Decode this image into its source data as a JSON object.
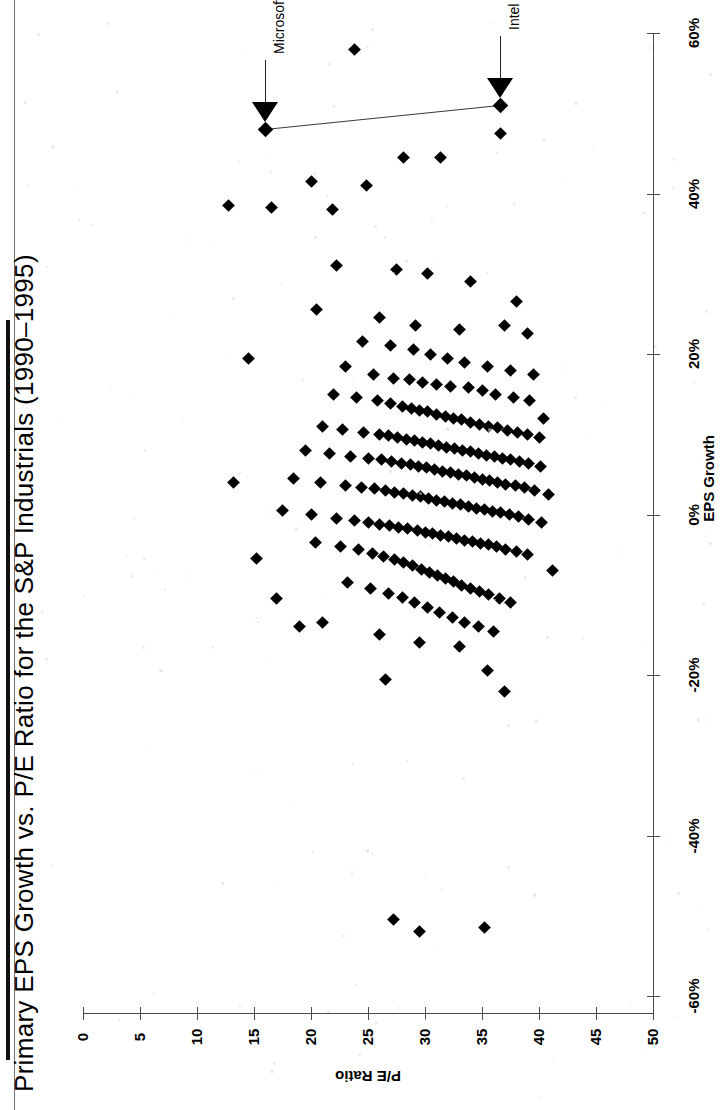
{
  "title": "Primary EPS Growth vs. P/E Ratio for the S&P Industrials (1990–1995)",
  "axes": {
    "pe": {
      "label": "P/E Ratio",
      "ticks": [
        "50",
        "45",
        "40",
        "35",
        "30",
        "25",
        "20",
        "15",
        "10",
        "5",
        "0"
      ]
    },
    "eps": {
      "label": "EPS Growth",
      "ticks": [
        "60%",
        "40%",
        "20%",
        "0%",
        "-20%",
        "-40%",
        "-60%"
      ]
    }
  },
  "annotations": [
    {
      "name": "microsoft",
      "label": "Microsoft"
    },
    {
      "name": "intel",
      "label": "Intel"
    }
  ],
  "chart_data": {
    "type": "scatter",
    "title": "Primary EPS Growth vs. P/E Ratio for the S&P Industrials (1990–1995)",
    "orientation": "rotated-90",
    "xlabel": "P/E Ratio",
    "ylabel": "EPS Growth",
    "xlim": [
      0,
      50
    ],
    "ylim": [
      -60,
      60
    ],
    "xticks": [
      0,
      5,
      10,
      15,
      20,
      25,
      30,
      35,
      40,
      45,
      50
    ],
    "yticks": [
      -60,
      -40,
      -20,
      0,
      20,
      40,
      60
    ],
    "ytick_format": "percent",
    "grid": false,
    "legend": null,
    "marker": "diamond",
    "marker_color": "#000000",
    "annotations": [
      {
        "label": "Microsoft",
        "pe": 34.0,
        "eps": 48.0
      },
      {
        "label": "Intel",
        "pe": 13.4,
        "eps": 51.0
      }
    ],
    "connector": {
      "from": "Microsoft",
      "to": "Intel"
    },
    "points": [
      [
        34.0,
        48.0
      ],
      [
        13.4,
        51.0
      ],
      [
        13.4,
        47.5
      ],
      [
        26.2,
        58.0
      ],
      [
        21.9,
        44.5
      ],
      [
        18.6,
        44.5
      ],
      [
        30.0,
        41.5
      ],
      [
        25.1,
        41.0
      ],
      [
        37.2,
        38.5
      ],
      [
        33.5,
        38.3
      ],
      [
        28.1,
        38.0
      ],
      [
        27.8,
        31.0
      ],
      [
        22.5,
        30.5
      ],
      [
        19.8,
        30.0
      ],
      [
        16.0,
        29.0
      ],
      [
        29.5,
        25.5
      ],
      [
        24.0,
        24.5
      ],
      [
        20.8,
        23.5
      ],
      [
        17.0,
        23.0
      ],
      [
        13.0,
        23.5
      ],
      [
        11.0,
        22.5
      ],
      [
        25.5,
        21.5
      ],
      [
        23.0,
        21.0
      ],
      [
        21.0,
        20.5
      ],
      [
        19.5,
        20.0
      ],
      [
        18.0,
        19.5
      ],
      [
        16.5,
        19.0
      ],
      [
        14.5,
        18.5
      ],
      [
        12.5,
        18.0
      ],
      [
        27.0,
        18.5
      ],
      [
        24.5,
        17.5
      ],
      [
        22.8,
        17.0
      ],
      [
        21.4,
        16.8
      ],
      [
        20.2,
        16.5
      ],
      [
        19.0,
        16.2
      ],
      [
        17.8,
        16.0
      ],
      [
        16.2,
        15.8
      ],
      [
        15.0,
        15.4
      ],
      [
        13.8,
        15.0
      ],
      [
        12.2,
        14.6
      ],
      [
        10.8,
        14.2
      ],
      [
        28.0,
        15.0
      ],
      [
        26.0,
        14.6
      ],
      [
        24.2,
        14.2
      ],
      [
        23.0,
        13.8
      ],
      [
        22.0,
        13.5
      ],
      [
        21.2,
        13.2
      ],
      [
        20.5,
        13.0
      ],
      [
        19.8,
        12.8
      ],
      [
        19.0,
        12.5
      ],
      [
        18.2,
        12.2
      ],
      [
        17.5,
        12.0
      ],
      [
        16.8,
        11.8
      ],
      [
        16.0,
        11.5
      ],
      [
        15.2,
        11.2
      ],
      [
        14.4,
        11.0
      ],
      [
        13.6,
        10.8
      ],
      [
        12.8,
        10.5
      ],
      [
        11.9,
        10.2
      ],
      [
        11.0,
        10.0
      ],
      [
        10.0,
        9.6
      ],
      [
        29.0,
        11.0
      ],
      [
        27.2,
        10.6
      ],
      [
        25.4,
        10.2
      ],
      [
        24.0,
        10.0
      ],
      [
        23.2,
        9.8
      ],
      [
        22.4,
        9.6
      ],
      [
        21.6,
        9.4
      ],
      [
        20.9,
        9.2
      ],
      [
        20.2,
        9.0
      ],
      [
        19.5,
        8.8
      ],
      [
        18.8,
        8.6
      ],
      [
        18.1,
        8.4
      ],
      [
        17.4,
        8.2
      ],
      [
        16.7,
        8.0
      ],
      [
        16.0,
        7.8
      ],
      [
        15.3,
        7.6
      ],
      [
        14.6,
        7.4
      ],
      [
        13.9,
        7.2
      ],
      [
        13.2,
        7.0
      ],
      [
        12.5,
        6.8
      ],
      [
        11.7,
        6.6
      ],
      [
        10.9,
        6.4
      ],
      [
        9.9,
        6.0
      ],
      [
        30.5,
        8.0
      ],
      [
        28.4,
        7.6
      ],
      [
        26.5,
        7.2
      ],
      [
        25.0,
        7.0
      ],
      [
        23.8,
        6.8
      ],
      [
        22.9,
        6.6
      ],
      [
        22.1,
        6.4
      ],
      [
        21.3,
        6.2
      ],
      [
        20.6,
        6.0
      ],
      [
        19.9,
        5.8
      ],
      [
        19.2,
        5.6
      ],
      [
        18.5,
        5.4
      ],
      [
        17.8,
        5.2
      ],
      [
        17.1,
        5.0
      ],
      [
        16.4,
        4.8
      ],
      [
        15.7,
        4.6
      ],
      [
        15.0,
        4.4
      ],
      [
        14.3,
        4.2
      ],
      [
        13.6,
        4.0
      ],
      [
        12.9,
        3.8
      ],
      [
        12.1,
        3.6
      ],
      [
        11.3,
        3.4
      ],
      [
        10.4,
        3.0
      ],
      [
        31.5,
        4.5
      ],
      [
        29.2,
        4.0
      ],
      [
        27.0,
        3.6
      ],
      [
        25.6,
        3.4
      ],
      [
        24.4,
        3.2
      ],
      [
        23.5,
        3.0
      ],
      [
        22.7,
        2.8
      ],
      [
        21.9,
        2.6
      ],
      [
        21.1,
        2.4
      ],
      [
        20.4,
        2.2
      ],
      [
        19.7,
        2.0
      ],
      [
        19.0,
        1.8
      ],
      [
        18.3,
        1.6
      ],
      [
        17.6,
        1.4
      ],
      [
        16.9,
        1.2
      ],
      [
        16.2,
        1.0
      ],
      [
        15.5,
        0.8
      ],
      [
        14.8,
        0.6
      ],
      [
        14.1,
        0.4
      ],
      [
        13.4,
        0.2
      ],
      [
        12.6,
        0.0
      ],
      [
        11.8,
        -0.3
      ],
      [
        10.9,
        -0.6
      ],
      [
        9.8,
        -1.0
      ],
      [
        32.5,
        0.5
      ],
      [
        30.0,
        0.0
      ],
      [
        27.8,
        -0.5
      ],
      [
        26.2,
        -0.8
      ],
      [
        25.0,
        -1.0
      ],
      [
        24.0,
        -1.2
      ],
      [
        23.1,
        -1.4
      ],
      [
        22.3,
        -1.6
      ],
      [
        21.5,
        -1.8
      ],
      [
        20.7,
        -2.0
      ],
      [
        20.0,
        -2.2
      ],
      [
        19.3,
        -2.4
      ],
      [
        18.6,
        -2.6
      ],
      [
        17.9,
        -2.8
      ],
      [
        17.2,
        -3.0
      ],
      [
        16.5,
        -3.2
      ],
      [
        15.8,
        -3.4
      ],
      [
        15.1,
        -3.6
      ],
      [
        14.4,
        -3.8
      ],
      [
        13.7,
        -4.0
      ],
      [
        12.9,
        -4.3
      ],
      [
        12.0,
        -4.6
      ],
      [
        11.0,
        -5.0
      ],
      [
        29.6,
        -3.5
      ],
      [
        27.4,
        -4.0
      ],
      [
        25.8,
        -4.4
      ],
      [
        24.6,
        -4.8
      ],
      [
        23.6,
        -5.2
      ],
      [
        22.7,
        -5.6
      ],
      [
        21.9,
        -6.0
      ],
      [
        21.1,
        -6.4
      ],
      [
        20.3,
        -6.8
      ],
      [
        19.6,
        -7.2
      ],
      [
        18.9,
        -7.6
      ],
      [
        18.2,
        -8.0
      ],
      [
        17.5,
        -8.4
      ],
      [
        16.8,
        -8.8
      ],
      [
        16.0,
        -9.2
      ],
      [
        15.2,
        -9.6
      ],
      [
        14.4,
        -10.0
      ],
      [
        13.5,
        -10.5
      ],
      [
        12.5,
        -11.0
      ],
      [
        26.8,
        -8.5
      ],
      [
        24.8,
        -9.2
      ],
      [
        23.2,
        -9.8
      ],
      [
        22.0,
        -10.4
      ],
      [
        20.9,
        -11.0
      ],
      [
        19.8,
        -11.6
      ],
      [
        18.7,
        -12.2
      ],
      [
        17.6,
        -12.8
      ],
      [
        16.5,
        -13.4
      ],
      [
        15.3,
        -14.0
      ],
      [
        14.0,
        -14.6
      ],
      [
        29.0,
        -13.5
      ],
      [
        24.0,
        -15.0
      ],
      [
        20.5,
        -16.0
      ],
      [
        17.0,
        -16.5
      ],
      [
        23.5,
        -20.5
      ],
      [
        14.5,
        -19.5
      ],
      [
        13.0,
        -22.0
      ],
      [
        22.8,
        -50.5
      ],
      [
        20.5,
        -52.0
      ],
      [
        14.8,
        -51.5
      ],
      [
        35.5,
        19.5
      ],
      [
        36.8,
        4.0
      ],
      [
        34.8,
        -5.5
      ],
      [
        33.0,
        -10.5
      ],
      [
        31.0,
        -14.0
      ],
      [
        12.0,
        26.5
      ],
      [
        10.5,
        17.5
      ],
      [
        9.6,
        12.0
      ],
      [
        9.2,
        2.5
      ],
      [
        8.8,
        -7.0
      ]
    ]
  }
}
